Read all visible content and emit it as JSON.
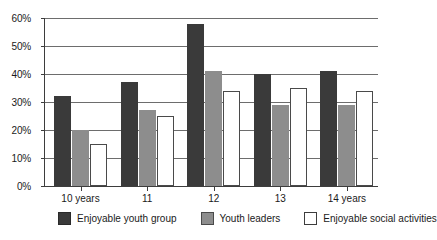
{
  "chart_data": {
    "type": "bar",
    "title": "",
    "subtitle": "",
    "xlabel": "",
    "ylabel": "",
    "categories": [
      "10 years",
      "11",
      "12",
      "13",
      "14 years"
    ],
    "series": [
      {
        "name": "Enjoyable youth group",
        "color": "#3a3a3a",
        "values": [
          32,
          37,
          58,
          40,
          41
        ]
      },
      {
        "name": "Youth leaders",
        "color": "#8d8d8d",
        "values": [
          20,
          27,
          41,
          29,
          29
        ]
      },
      {
        "name": "Enjoyable social activities",
        "color": "#ffffff",
        "values": [
          15,
          25,
          34,
          35,
          34
        ]
      }
    ],
    "ylim": [
      0,
      60
    ],
    "ytick_values": [
      0,
      10,
      20,
      30,
      40,
      50,
      60
    ],
    "ytick_labels": [
      "0%",
      "10%",
      "20%",
      "30%",
      "40%",
      "50%",
      "60%"
    ],
    "grid": true,
    "grid_axis": "y",
    "legend_position": "bottom",
    "value_suffix": "%"
  }
}
